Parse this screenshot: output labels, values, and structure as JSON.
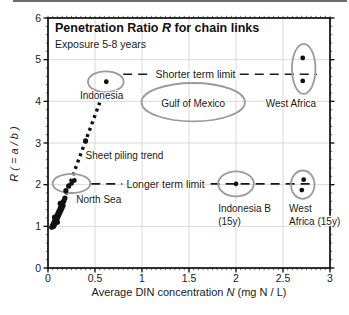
{
  "figure": {
    "title_pre": "Penetration Ratio ",
    "title_var": "R",
    "title_post": " for chain links",
    "subtitle": "Exposure 5-8 years",
    "xlabel_pre": "Average DIN concentration ",
    "xlabel_var": "N",
    "xlabel_post": " (mg N / L)",
    "ylabel": "R ( = a / b )"
  },
  "chart_data": {
    "type": "scatter",
    "title": "Penetration Ratio R for chain links",
    "subtitle": "Exposure 5-8 years",
    "xlabel": "Average DIN concentration N (mg N / L)",
    "ylabel": "R ( = a / b )",
    "xlim": [
      0,
      3
    ],
    "ylim": [
      0,
      6
    ],
    "grid": true,
    "x_ticks": [
      {
        "v": 0,
        "label": "0"
      },
      {
        "v": 0.5,
        "label": "0.5"
      },
      {
        "v": 1,
        "label": "1"
      },
      {
        "v": 1.5,
        "label": "1.5"
      },
      {
        "v": 2,
        "label": "2"
      },
      {
        "v": 2.5,
        "label": "2.5"
      },
      {
        "v": 3,
        "label": "3"
      }
    ],
    "y_ticks": [
      {
        "v": 0,
        "label": "0"
      },
      {
        "v": 1,
        "label": "1"
      },
      {
        "v": 2,
        "label": "2"
      },
      {
        "v": 3,
        "label": "3"
      },
      {
        "v": 4,
        "label": "4"
      },
      {
        "v": 5,
        "label": "5"
      },
      {
        "v": 6,
        "label": "6"
      }
    ],
    "x_minor_step": 0.05,
    "y_minor_step": 0.2,
    "colors": {
      "points": "#111111",
      "ellipses": "#9b9b9b",
      "grid": "#d9d9d9",
      "frame": "#1a1a1a",
      "text": "#1a1a1a"
    },
    "series": [
      {
        "name": "north-sea-cluster",
        "r": 2.6,
        "points": [
          [
            0.04,
            0.98
          ],
          [
            0.05,
            1.03
          ],
          [
            0.06,
            1.0
          ],
          [
            0.06,
            1.08
          ],
          [
            0.07,
            1.05
          ],
          [
            0.07,
            1.13
          ],
          [
            0.08,
            1.1
          ],
          [
            0.08,
            1.18
          ],
          [
            0.09,
            1.15
          ],
          [
            0.09,
            1.23
          ],
          [
            0.1,
            1.2
          ],
          [
            0.1,
            1.28
          ],
          [
            0.11,
            1.25
          ],
          [
            0.11,
            1.33
          ],
          [
            0.12,
            1.3
          ],
          [
            0.12,
            1.38
          ],
          [
            0.13,
            1.35
          ],
          [
            0.13,
            1.43
          ],
          [
            0.14,
            1.4
          ],
          [
            0.14,
            1.48
          ],
          [
            0.15,
            1.45
          ],
          [
            0.15,
            1.53
          ],
          [
            0.16,
            1.5
          ],
          [
            0.16,
            1.58
          ],
          [
            0.17,
            1.62
          ],
          [
            0.18,
            1.68
          ],
          [
            0.13,
            1.55
          ],
          [
            0.1,
            1.1
          ],
          [
            0.07,
            1.22
          ],
          [
            0.19,
            1.86
          ],
          [
            0.22,
            1.97
          ]
        ]
      },
      {
        "name": "north-sea",
        "r": 2.4,
        "points": [
          [
            0.25,
            2.03
          ],
          [
            0.28,
            2.1
          ]
        ]
      },
      {
        "name": "sheet-piling-point",
        "r": 2.6,
        "points": [
          [
            0.4,
            3.05
          ]
        ]
      },
      {
        "name": "indonesia",
        "r": 2.4,
        "points": [
          [
            0.62,
            4.47
          ]
        ]
      },
      {
        "name": "west-africa",
        "r": 2.4,
        "points": [
          [
            2.71,
            5.04
          ],
          [
            2.71,
            4.49
          ]
        ]
      },
      {
        "name": "indonesia-b-15y",
        "r": 2.4,
        "points": [
          [
            2.0,
            2.02
          ]
        ]
      },
      {
        "name": "west-africa-15y",
        "r": 2.4,
        "points": [
          [
            2.72,
            2.12
          ],
          [
            2.7,
            1.87
          ]
        ]
      }
    ],
    "reference_lines": [
      {
        "name": "shorter-term-limit",
        "label": "Shorter term limit",
        "y": 4.65,
        "segments": [
          [
            0.8,
            1.11
          ],
          [
            2.04,
            2.86
          ]
        ],
        "label_x": 1.57
      },
      {
        "name": "longer-term-limit",
        "label": "Longer term limit",
        "y": 2.02,
        "segments": [
          [
            0.46,
            0.79
          ],
          [
            1.73,
            2.83
          ]
        ],
        "label_x": 1.25
      }
    ],
    "trend_line": {
      "name": "sheet-piling-trend",
      "label": "Sheet piling trend",
      "from": [
        0.065,
        1.0
      ],
      "to": [
        0.55,
        3.97
      ]
    },
    "group_ellipses": [
      {
        "name": "indonesia",
        "cx": 0.615,
        "cy": 4.47,
        "rx": 0.19,
        "ry": 0.25
      },
      {
        "name": "gulf-of-mexico",
        "cx": 1.545,
        "cy": 3.98,
        "rx": 0.55,
        "ry": 0.46
      },
      {
        "name": "west-africa",
        "cx": 2.72,
        "cy": 4.78,
        "rx": 0.125,
        "ry": 0.6
      },
      {
        "name": "north-sea",
        "cx": 0.25,
        "cy": 2.03,
        "rx": 0.2,
        "ry": 0.23
      },
      {
        "name": "indonesia-b-15y",
        "cx": 2.0,
        "cy": 2.02,
        "rx": 0.19,
        "ry": 0.3
      },
      {
        "name": "west-africa-15y",
        "cx": 2.71,
        "cy": 2.0,
        "rx": 0.125,
        "ry": 0.34
      }
    ],
    "annotations": [
      {
        "name": "indonesia-label",
        "lines": [
          "Indonesia"
        ],
        "x": 0.57,
        "y": 4.05,
        "anchor": "middle"
      },
      {
        "name": "gulf-of-mexico-label",
        "lines": [
          "Gulf of Mexico"
        ],
        "x": 1.545,
        "y": 3.87,
        "anchor": "middle"
      },
      {
        "name": "west-africa-label",
        "lines": [
          "West Africa"
        ],
        "x": 2.585,
        "y": 3.87,
        "anchor": "middle"
      },
      {
        "name": "sheet-piling-trend-label",
        "lines": [
          "Sheet piling trend"
        ],
        "x": 0.4,
        "y": 2.62,
        "anchor": "start"
      },
      {
        "name": "north-sea-label",
        "lines": [
          "North Sea"
        ],
        "x": 0.3,
        "y": 1.55,
        "anchor": "start"
      },
      {
        "name": "indonesia-b-label",
        "lines": [
          "Indonesia B",
          "(15y)"
        ],
        "x": 1.81,
        "y": 1.34,
        "anchor": "start"
      },
      {
        "name": "west-africa-15y-label",
        "lines": [
          "West",
          "Africa (15y)"
        ],
        "x": 2.565,
        "y": 1.34,
        "anchor": "start"
      }
    ]
  }
}
